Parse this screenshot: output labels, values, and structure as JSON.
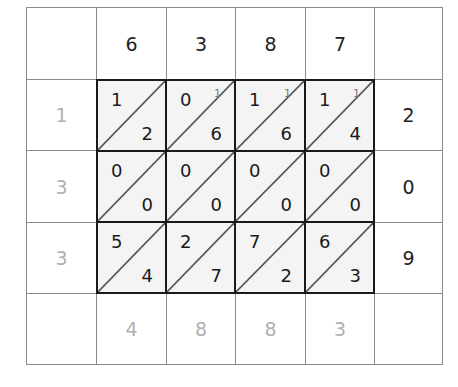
{
  "diagram": {
    "type": "lattice-multiplication",
    "top_digits": [
      "6",
      "3",
      "8",
      "7"
    ],
    "right_digits": [
      "2",
      "0",
      "9"
    ],
    "left_sum_digits": [
      "1",
      "3",
      "3"
    ],
    "bottom_sum_digits": [
      "4",
      "8",
      "8",
      "3"
    ],
    "lattice": [
      [
        {
          "tens": "1",
          "ones": "2",
          "carry": ""
        },
        {
          "tens": "0",
          "ones": "6",
          "carry": "1"
        },
        {
          "tens": "1",
          "ones": "6",
          "carry": "1"
        },
        {
          "tens": "1",
          "ones": "4",
          "carry": "1"
        }
      ],
      [
        {
          "tens": "0",
          "ones": "0",
          "carry": ""
        },
        {
          "tens": "0",
          "ones": "0",
          "carry": ""
        },
        {
          "tens": "0",
          "ones": "0",
          "carry": ""
        },
        {
          "tens": "0",
          "ones": "0",
          "carry": ""
        }
      ],
      [
        {
          "tens": "5",
          "ones": "4",
          "carry": ""
        },
        {
          "tens": "2",
          "ones": "7",
          "carry": ""
        },
        {
          "tens": "7",
          "ones": "2",
          "carry": ""
        },
        {
          "tens": "6",
          "ones": "3",
          "carry": ""
        }
      ]
    ],
    "colors": {
      "border": "#8a8a8a",
      "lattice_border": "#1a1a1a",
      "lattice_fill": "#f4f4f4",
      "faded_digit": "#b0b0b0",
      "digit": "#222222"
    }
  }
}
